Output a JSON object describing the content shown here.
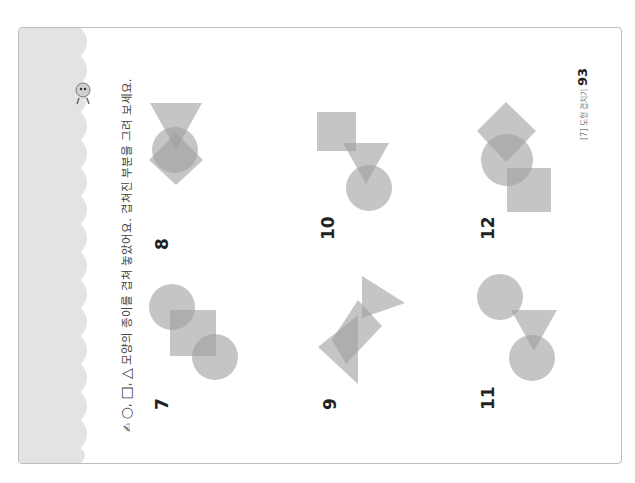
{
  "header": {
    "bullet_icon": "pencil-hand-icon",
    "shape_symbols": [
      "○",
      "□",
      "△"
    ],
    "instruction": "모양의 종이를 겹쳐 놓았어요. 겹쳐진 부분을 그려 보세요."
  },
  "problems": [
    {
      "number": "7",
      "shapes": [
        "circle",
        "square",
        "circle"
      ]
    },
    {
      "number": "8",
      "shapes": [
        "triangle",
        "circle",
        "diamond"
      ]
    },
    {
      "number": "9",
      "shapes": [
        "triangle",
        "square",
        "triangle"
      ]
    },
    {
      "number": "10",
      "shapes": [
        "square",
        "triangle",
        "circle"
      ]
    },
    {
      "number": "11",
      "shapes": [
        "circle",
        "triangle",
        "circle"
      ]
    },
    {
      "number": "12",
      "shapes": [
        "diamond",
        "circle",
        "square"
      ]
    }
  ],
  "footer": {
    "chapter": "[7] 도형 겹치기",
    "page_number": "93"
  },
  "colors": {
    "shape_fill": "#9e9e9e",
    "band": "#e3e3e3",
    "border": "#bdbdbd"
  }
}
